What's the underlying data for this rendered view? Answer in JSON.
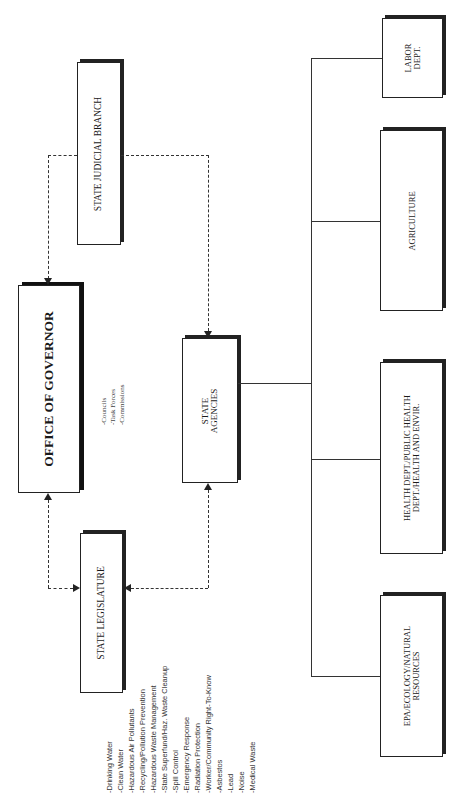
{
  "diagram": {
    "orientation": "rotated-90-ccw",
    "nodes": {
      "governor": {
        "label": "OFFICE OF GOVERNOR"
      },
      "judicial": {
        "label": "STATE JUDICIAL BRANCH"
      },
      "legislature": {
        "label": "STATE LEGISLATURE"
      },
      "agencies": {
        "line1": "STATE",
        "line2": "AGENCIES"
      },
      "labor": {
        "line1": "LABOR",
        "line2": "DEPT."
      },
      "agriculture": {
        "label": "AGRICULTURE"
      },
      "health": {
        "line1": "HEALTH DEPT./PUBLIC HEALTH",
        "line2": "DEPT./HEALTH AND ENVIR."
      },
      "epa": {
        "line1": "EPA/ECOLOGY/NATURAL",
        "line2": "RESOURCES"
      }
    },
    "governor_notes": [
      "-Councils",
      "-Task Forces",
      "-Commissions"
    ],
    "legislature_topics": [
      "-Drinking Water",
      "-Clean Water",
      "-Hazardous Air Pollutants",
      "-Recycling/Pollution Prevention",
      "-Hazardous Waste Management",
      "-State Superfund/Haz. Waste Cleanup",
      "-Spill Control",
      "-Emergency Response",
      "-Radiation Protection",
      "-Worker/Community Right-To-Know",
      "-Asbestos",
      "-Lead",
      "-Noise",
      "-Medical Waste"
    ],
    "edges": [
      {
        "from": "governor",
        "to": "judicial",
        "style": "dashed",
        "bidirectional": true
      },
      {
        "from": "governor",
        "to": "legislature",
        "style": "dashed",
        "bidirectional": true
      },
      {
        "from": "judicial",
        "to": "agencies",
        "style": "dashed",
        "arrow": "to agencies"
      },
      {
        "from": "legislature",
        "to": "agencies",
        "style": "dashed",
        "bidirectional": true
      },
      {
        "from": "agencies",
        "to": "labor",
        "style": "solid"
      },
      {
        "from": "agencies",
        "to": "agriculture",
        "style": "solid"
      },
      {
        "from": "agencies",
        "to": "health",
        "style": "solid"
      },
      {
        "from": "agencies",
        "to": "epa",
        "style": "solid"
      }
    ]
  }
}
